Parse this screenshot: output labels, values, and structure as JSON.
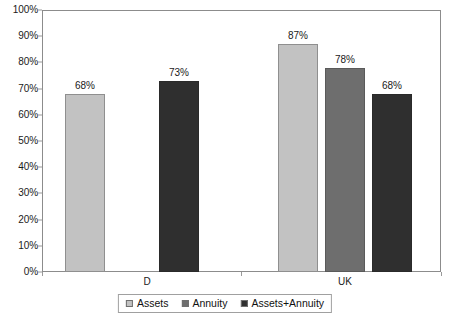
{
  "chart_data": {
    "type": "bar",
    "title": "",
    "xlabel": "",
    "ylabel": "",
    "ylim": [
      0,
      100
    ],
    "grid": false,
    "legend_position": "bottom",
    "categories": [
      "D",
      "UK"
    ],
    "y_ticks": [
      "0%",
      "10%",
      "20%",
      "30%",
      "40%",
      "50%",
      "60%",
      "70%",
      "80%",
      "90%",
      "100%"
    ],
    "y_tick_values": [
      0,
      10,
      20,
      30,
      40,
      50,
      60,
      70,
      80,
      90,
      100
    ],
    "series": [
      {
        "name": "Assets",
        "color": "#c2c2c2",
        "values": [
          68,
          87
        ],
        "labels": [
          "68%",
          "87%"
        ]
      },
      {
        "name": "Annuity",
        "color": "#6e6e6e",
        "values": [
          null,
          78
        ],
        "labels": [
          "",
          "78%"
        ]
      },
      {
        "name": "Assets+Annuity",
        "color": "#2f2f2f",
        "values": [
          73,
          68
        ],
        "labels": [
          "73%",
          "68%"
        ]
      }
    ],
    "bars": [
      {
        "group": "D",
        "series": "Assets",
        "value": 68,
        "label": "68%",
        "color_key": "series-assets",
        "left": 23,
        "width": 40
      },
      {
        "group": "D",
        "series": "Assets+Annuity",
        "value": 73,
        "label": "73%",
        "color_key": "series-assets-annuity",
        "left": 117,
        "width": 40
      },
      {
        "group": "UK",
        "series": "Assets",
        "value": 87,
        "label": "87%",
        "color_key": "series-assets",
        "left": 236,
        "width": 40
      },
      {
        "group": "UK",
        "series": "Annuity",
        "value": 78,
        "label": "78%",
        "color_key": "series-annuity",
        "left": 283,
        "width": 40
      },
      {
        "group": "UK",
        "series": "Assets+Annuity",
        "value": 68,
        "label": "68%",
        "color_key": "series-assets-annuity",
        "left": 330,
        "width": 40
      }
    ],
    "group_label_positions": [
      {
        "label": "D",
        "center": 105
      },
      {
        "label": "UK",
        "center": 303
      }
    ],
    "axis_tick_positions": [
      0,
      199,
      399
    ]
  }
}
